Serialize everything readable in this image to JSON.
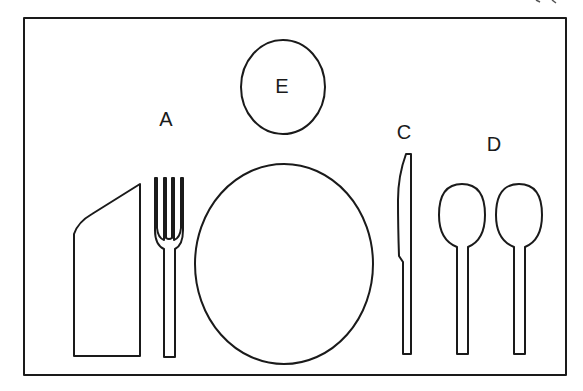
{
  "diagram": {
    "labels": {
      "fork": "A",
      "dinner_plate": "B",
      "knife": "C",
      "spoons": "D",
      "bread_plate": "E"
    },
    "items": [
      {
        "id": "napkin",
        "label": ""
      },
      {
        "id": "fork",
        "label": "A"
      },
      {
        "id": "dinner-plate",
        "label": "B"
      },
      {
        "id": "knife",
        "label": "C"
      },
      {
        "id": "spoons",
        "label": "D"
      },
      {
        "id": "bread-plate",
        "label": "E"
      }
    ],
    "colors": {
      "stroke": "#1a1a1a",
      "background": "#ffffff"
    }
  }
}
